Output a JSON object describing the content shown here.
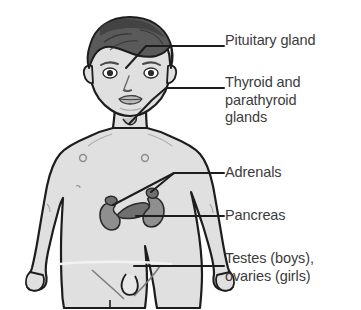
{
  "diagram": {
    "colors": {
      "ink": "#1d1d1d",
      "skin": "#e0e0e0",
      "skin_shadow": "#cfcfcf",
      "hair": "#5a5a5a",
      "hair_dark": "#3c3c3c",
      "organ": "#8f8f8f",
      "organ_dark": "#6f6f6f",
      "text": "#3b3b3b",
      "background": "#ffffff"
    }
  },
  "labels": [
    {
      "id": "pituitary",
      "text": "Pituitary gland",
      "leader": "line from brain to right margin"
    },
    {
      "id": "thyroid",
      "text": "Thyroid and\nparathyroid\nglands",
      "leader": "line from throat to right margin"
    },
    {
      "id": "adrenals",
      "text": "Adrenals",
      "leader": "forked line to both adrenal caps"
    },
    {
      "id": "pancreas",
      "text": "Pancreas",
      "leader": "line from pancreas to right margin"
    },
    {
      "id": "gonads",
      "text": "Testes (boys),\novaries (girls)",
      "leader": "line from groin to right margin"
    }
  ],
  "organs": [
    {
      "id": "left-kidney",
      "name": "kidney"
    },
    {
      "id": "right-kidney",
      "name": "kidney"
    },
    {
      "id": "left-adrenal",
      "name": "adrenal-gland"
    },
    {
      "id": "right-adrenal",
      "name": "adrenal-gland"
    },
    {
      "id": "pancreas-organ",
      "name": "pancreas"
    }
  ]
}
